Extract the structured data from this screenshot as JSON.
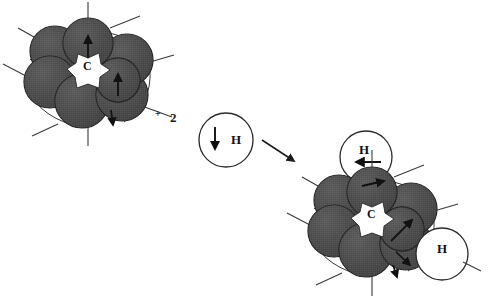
{
  "figure": {
    "type": "reaction-scheme",
    "background_color": "#ffffff"
  },
  "colors": {
    "sphere_fill": "#4d4d4d",
    "sphere_stroke": "#1a1a1a",
    "hydrogen_fill": "#ffffff",
    "hydrogen_stroke": "#2b2b2b",
    "bond_line": "#3a3a3a",
    "arrow": "#111111",
    "text": "#121212"
  },
  "reactant": {
    "name": "metal-cluster-reactant",
    "center_label": "C",
    "sphere_count": 7,
    "arrow_count": 3,
    "spheres": [
      {
        "cx": 88,
        "cy": 43,
        "r": 25,
        "z": 3
      },
      {
        "cx": 127,
        "cy": 60,
        "r": 26,
        "z": 2
      },
      {
        "cx": 122,
        "cy": 95,
        "r": 26,
        "z": 2
      },
      {
        "cx": 82,
        "cy": 101,
        "r": 27,
        "z": 1
      },
      {
        "cx": 50,
        "cy": 82,
        "r": 26,
        "z": 1
      },
      {
        "cx": 55,
        "cy": 51,
        "r": 25,
        "z": 1
      },
      {
        "cx": 118,
        "cy": 80,
        "r": 22,
        "z": 4
      }
    ],
    "bonds": [
      {
        "x1": 88,
        "y1": 18,
        "x2": 88,
        "y2": 2
      },
      {
        "x1": 110,
        "y1": 28,
        "x2": 140,
        "y2": 16
      },
      {
        "x1": 150,
        "y1": 62,
        "x2": 174,
        "y2": 55
      },
      {
        "x1": 142,
        "y1": 106,
        "x2": 172,
        "y2": 117
      },
      {
        "x1": 88,
        "y1": 127,
        "x2": 88,
        "y2": 146
      },
      {
        "x1": 58,
        "y1": 124,
        "x2": 32,
        "y2": 136
      },
      {
        "x1": 26,
        "y1": 76,
        "x2": 3,
        "y2": 64
      },
      {
        "x1": 34,
        "y1": 37,
        "x2": 18,
        "y2": 28
      }
    ],
    "displacement_arrows": [
      {
        "x1": 88,
        "y1": 56,
        "x2": 88,
        "y2": 34,
        "name": "top-sphere-arrow"
      },
      {
        "x1": 118,
        "y1": 95,
        "x2": 118,
        "y2": 73,
        "name": "right-sphere-arrow"
      },
      {
        "x1": 112,
        "y1": 112,
        "x2": 114,
        "y2": 126,
        "name": "bottom-sphere-arrow"
      }
    ]
  },
  "plus": {
    "sign": "+",
    "coefficient": "2"
  },
  "reactant_hydrogen": {
    "name": "hydrogen-atom-reactant",
    "label": "H",
    "cx": 226,
    "cy": 140,
    "r": 27,
    "arrow": {
      "x1": 215,
      "y1": 128,
      "x2": 215,
      "y2": 150
    }
  },
  "reaction_arrow": {
    "name": "reaction-arrow",
    "x1": 262,
    "y1": 140,
    "x2": 296,
    "y2": 162
  },
  "product": {
    "name": "metal-cluster-product",
    "center_label": "C",
    "sphere_count": 7,
    "arrow_count": 4,
    "spheres": [
      {
        "cx": 372,
        "cy": 192,
        "r": 25,
        "z": 3
      },
      {
        "cx": 411,
        "cy": 209,
        "r": 26,
        "z": 2
      },
      {
        "cx": 406,
        "cy": 244,
        "r": 26,
        "z": 2
      },
      {
        "cx": 366,
        "cy": 250,
        "r": 27,
        "z": 1
      },
      {
        "cx": 334,
        "cy": 231,
        "r": 26,
        "z": 1
      },
      {
        "cx": 339,
        "cy": 200,
        "r": 25,
        "z": 1
      },
      {
        "cx": 402,
        "cy": 229,
        "r": 22,
        "z": 4
      }
    ],
    "bonds": [
      {
        "x1": 372,
        "y1": 167,
        "x2": 372,
        "y2": 150
      },
      {
        "x1": 394,
        "y1": 177,
        "x2": 424,
        "y2": 165
      },
      {
        "x1": 434,
        "y1": 211,
        "x2": 458,
        "y2": 204
      },
      {
        "x1": 426,
        "y1": 255,
        "x2": 456,
        "y2": 266
      },
      {
        "x1": 372,
        "y1": 276,
        "x2": 372,
        "y2": 296
      },
      {
        "x1": 342,
        "y1": 273,
        "x2": 316,
        "y2": 285
      },
      {
        "x1": 310,
        "y1": 225,
        "x2": 287,
        "y2": 213
      },
      {
        "x1": 318,
        "y1": 186,
        "x2": 302,
        "y2": 177
      }
    ],
    "displacement_arrows": [
      {
        "x1": 363,
        "y1": 186,
        "x2": 385,
        "y2": 181,
        "name": "top-sphere-arrow"
      },
      {
        "x1": 392,
        "y1": 240,
        "x2": 412,
        "y2": 221,
        "name": "right-sphere-arrow"
      },
      {
        "x1": 397,
        "y1": 253,
        "x2": 411,
        "y2": 266,
        "name": "lower-right-arrow"
      },
      {
        "x1": 394,
        "y1": 266,
        "x2": 398,
        "y2": 278,
        "name": "bottom-sphere-arrow"
      }
    ]
  },
  "product_hydrogens": [
    {
      "name": "hydrogen-atom-product-top",
      "label": "H",
      "cx": 366,
      "cy": 157,
      "r": 26,
      "arrow": {
        "x1": 380,
        "y1": 162,
        "x2": 355,
        "y2": 162
      }
    },
    {
      "name": "hydrogen-atom-product-right",
      "label": "H",
      "cx": 442,
      "cy": 254,
      "r": 26,
      "arrow": {
        "x1": 426,
        "y1": 229,
        "x2": 415,
        "y2": 246
      }
    }
  ]
}
